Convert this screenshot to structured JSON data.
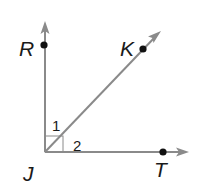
{
  "diagram": {
    "type": "geometry-angles",
    "colors": {
      "ray": "#8a8a8a",
      "point": "#111111",
      "label": "#1a1a1a",
      "right_angle_mark": "#8a8a8a"
    },
    "vertex": {
      "label": "J"
    },
    "points": [
      {
        "label": "R",
        "on_ray": "JR"
      },
      {
        "label": "K",
        "on_ray": "JK"
      },
      {
        "label": "T",
        "on_ray": "JT"
      }
    ],
    "rays": [
      {
        "name": "JR",
        "direction": "up"
      },
      {
        "name": "JK",
        "direction": "diagonal-up-right"
      },
      {
        "name": "JT",
        "direction": "right"
      }
    ],
    "angles": [
      {
        "label": "1",
        "between": [
          "JR",
          "JK"
        ]
      },
      {
        "label": "2",
        "between": [
          "JK",
          "JT"
        ]
      }
    ],
    "right_angle_marker": {
      "at": "J",
      "between": [
        "JR",
        "JT"
      ]
    }
  }
}
